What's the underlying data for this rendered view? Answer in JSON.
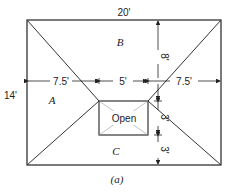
{
  "diagram": {
    "dimensions": {
      "top_width": "20'",
      "left_height": "14'",
      "left_span": "7.5'",
      "middle_span": "5'",
      "right_span": "7.5'",
      "upper_vertical": "8'",
      "open_height": "3'",
      "lower_vertical": "3'"
    },
    "regions": {
      "a": "A",
      "b": "B",
      "c": "C",
      "opening": "Open"
    },
    "caption": "(a)"
  }
}
